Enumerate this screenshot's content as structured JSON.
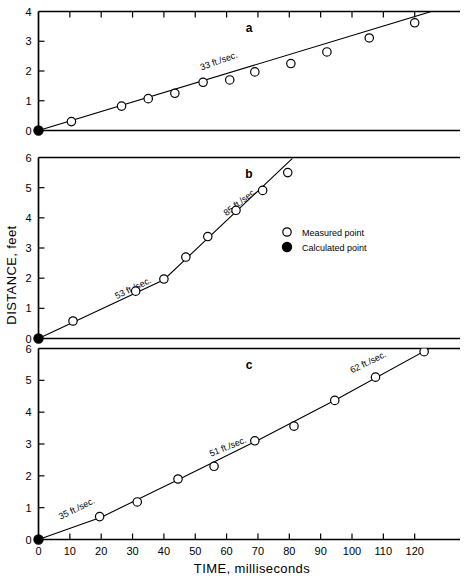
{
  "figure": {
    "xlabel": "TIME, milliseconds",
    "ylabel": "DISTANCE, feet",
    "legend": {
      "measured_label": "Measured point",
      "calculated_label": "Calculated point"
    }
  },
  "chart_data": {
    "type": "scatter",
    "title": "",
    "xlabel": "TIME, milliseconds",
    "ylabel": "DISTANCE, feet",
    "xlim": [
      0,
      130
    ],
    "xticks": [
      0,
      10,
      20,
      30,
      40,
      50,
      60,
      70,
      80,
      90,
      100,
      110,
      120
    ],
    "xticklabels": [
      "0",
      "10",
      "20",
      "30",
      "40",
      "50",
      "60",
      "70",
      "80",
      "90",
      "100",
      "110",
      "120"
    ],
    "grid": false,
    "legend": {
      "position": "middle-right",
      "entries": [
        {
          "label": "Measured point",
          "marker": "open-circle"
        },
        {
          "label": "Calculated point",
          "marker": "filled-circle"
        }
      ]
    },
    "panels": [
      {
        "id": "a",
        "label": "a",
        "ylim": [
          0,
          4
        ],
        "yticks": [
          0,
          1,
          2,
          3,
          4
        ],
        "yticklabels": [
          "0",
          "1",
          "2",
          "3",
          "4"
        ],
        "annotations": [
          {
            "text": "33 ft./sec.",
            "x": 52,
            "y": 2.02,
            "rotation": -20
          }
        ],
        "fit_line": {
          "points": [
            [
              0,
              0
            ],
            [
              130,
              4.15
            ]
          ]
        },
        "calculated_points": [
          {
            "x": 0,
            "y": 0
          }
        ],
        "measured_points": [
          {
            "x": 10.5,
            "y": 0.3
          },
          {
            "x": 26.5,
            "y": 0.82
          },
          {
            "x": 35.0,
            "y": 1.07
          },
          {
            "x": 43.5,
            "y": 1.25
          },
          {
            "x": 52.5,
            "y": 1.62
          },
          {
            "x": 61.0,
            "y": 1.7
          },
          {
            "x": 69.0,
            "y": 1.97
          },
          {
            "x": 80.5,
            "y": 2.25
          },
          {
            "x": 92.0,
            "y": 2.64
          },
          {
            "x": 105.5,
            "y": 3.11
          },
          {
            "x": 120.0,
            "y": 3.62
          }
        ]
      },
      {
        "id": "b",
        "label": "b",
        "ylim": [
          0,
          6
        ],
        "yticks": [
          0,
          1,
          2,
          3,
          4,
          5,
          6
        ],
        "yticklabels": [
          "0",
          "1",
          "2",
          "3",
          "4",
          "5",
          "6"
        ],
        "annotations": [
          {
            "text": "53 ft./sec.",
            "x": 25,
            "y": 1.3,
            "rotation": -26
          },
          {
            "text": "85 ft./sec.",
            "x": 60,
            "y": 4.05,
            "rotation": -38
          }
        ],
        "fit_line": {
          "points": [
            [
              0,
              0
            ],
            [
              40,
              1.95
            ],
            [
              81,
              5.97
            ]
          ]
        },
        "calculated_points": [
          {
            "x": 0,
            "y": 0
          }
        ],
        "measured_points": [
          {
            "x": 11.0,
            "y": 0.58
          },
          {
            "x": 31.0,
            "y": 1.57
          },
          {
            "x": 40.0,
            "y": 1.97
          },
          {
            "x": 47.0,
            "y": 2.7
          },
          {
            "x": 54.0,
            "y": 3.38
          },
          {
            "x": 63.0,
            "y": 4.25
          },
          {
            "x": 71.5,
            "y": 4.91
          },
          {
            "x": 79.5,
            "y": 5.5
          }
        ]
      },
      {
        "id": "c",
        "label": "c",
        "ylim": [
          0,
          6
        ],
        "yticks": [
          0,
          1,
          2,
          3,
          4,
          5,
          6
        ],
        "yticklabels": [
          "0",
          "1",
          "2",
          "3",
          "4",
          "5",
          "6"
        ],
        "annotations": [
          {
            "text": "35 ft./sec.",
            "x": 7,
            "y": 0.62,
            "rotation": -26
          },
          {
            "text": "51 ft./sec.",
            "x": 55,
            "y": 2.6,
            "rotation": -22
          },
          {
            "text": "62 ft./sec.",
            "x": 100,
            "y": 5.22,
            "rotation": -26
          }
        ],
        "fit_line": {
          "points": [
            [
              0,
              0
            ],
            [
              20,
              0.7
            ],
            [
              45,
              1.9
            ],
            [
              70,
              3.12
            ],
            [
              95,
              4.4
            ],
            [
              125,
              6.02
            ]
          ]
        },
        "calculated_points": [
          {
            "x": 0,
            "y": 0
          }
        ],
        "measured_points": [
          {
            "x": 19.5,
            "y": 0.72
          },
          {
            "x": 31.5,
            "y": 1.18
          },
          {
            "x": 44.5,
            "y": 1.9
          },
          {
            "x": 56.0,
            "y": 2.3
          },
          {
            "x": 69.0,
            "y": 3.1
          },
          {
            "x": 81.5,
            "y": 3.56
          },
          {
            "x": 94.5,
            "y": 4.37
          },
          {
            "x": 107.5,
            "y": 5.1
          },
          {
            "x": 123.0,
            "y": 5.9
          }
        ]
      }
    ]
  }
}
